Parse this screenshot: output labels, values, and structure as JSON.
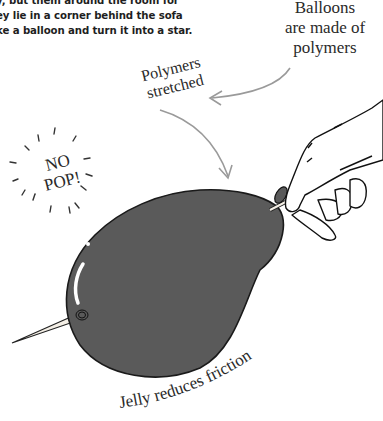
{
  "instructions": {
    "lines": [
      "y, but them around the room for",
      "ey lie in a corner behind the sofa",
      "ke a balloon and turn it into a star."
    ]
  },
  "labels": {
    "balloons_made_of_polymers": [
      "Balloons",
      "are made of",
      "polymers"
    ],
    "polymers_stretched": [
      "Polymers",
      "stretched"
    ],
    "no_pop": [
      "NO",
      "POP!"
    ],
    "jelly_reduces_friction": "Jelly reduces friction"
  },
  "colors": {
    "balloon_fill": "#5a5a5a",
    "outline": "#1a1a1a",
    "arrow": "#9a9a9a",
    "text": "#2a2a2a"
  }
}
